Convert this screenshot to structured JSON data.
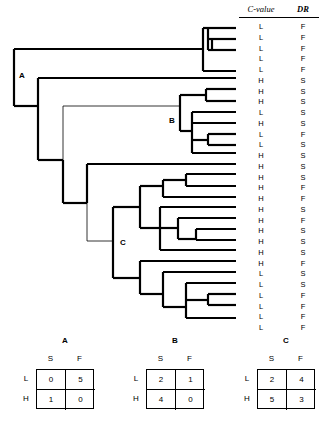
{
  "figure": {
    "type": "phylogenetic-tree-with-character-states"
  },
  "columns": {
    "cvalue_header": "C-value",
    "dr_header": "DR"
  },
  "clade_labels": {
    "a": "A",
    "b": "B",
    "c": "C"
  },
  "tips": [
    {
      "cvalue": "L",
      "dr": "F"
    },
    {
      "cvalue": "L",
      "dr": "F"
    },
    {
      "cvalue": "L",
      "dr": "F"
    },
    {
      "cvalue": "L",
      "dr": "F"
    },
    {
      "cvalue": "L",
      "dr": "F"
    },
    {
      "cvalue": "H",
      "dr": "S"
    },
    {
      "cvalue": "H",
      "dr": "S"
    },
    {
      "cvalue": "H",
      "dr": "S"
    },
    {
      "cvalue": "L",
      "dr": "S"
    },
    {
      "cvalue": "H",
      "dr": "S"
    },
    {
      "cvalue": "L",
      "dr": "F"
    },
    {
      "cvalue": "L",
      "dr": "S"
    },
    {
      "cvalue": "H",
      "dr": "S"
    },
    {
      "cvalue": "H",
      "dr": "S"
    },
    {
      "cvalue": "H",
      "dr": "S"
    },
    {
      "cvalue": "H",
      "dr": "F"
    },
    {
      "cvalue": "H",
      "dr": "F"
    },
    {
      "cvalue": "H",
      "dr": "S"
    },
    {
      "cvalue": "H",
      "dr": "F"
    },
    {
      "cvalue": "H",
      "dr": "S"
    },
    {
      "cvalue": "H",
      "dr": "S"
    },
    {
      "cvalue": "H",
      "dr": "S"
    },
    {
      "cvalue": "H",
      "dr": "F"
    },
    {
      "cvalue": "L",
      "dr": "S"
    },
    {
      "cvalue": "L",
      "dr": "S"
    },
    {
      "cvalue": "L",
      "dr": "F"
    },
    {
      "cvalue": "L",
      "dr": "F"
    },
    {
      "cvalue": "L",
      "dr": "F"
    },
    {
      "cvalue": "L",
      "dr": "F"
    }
  ],
  "tables": [
    {
      "id": "A",
      "title": "A",
      "col_headers": [
        "S",
        "F"
      ],
      "row_headers": [
        "L",
        "H"
      ],
      "values": [
        [
          0,
          5
        ],
        [
          1,
          0
        ]
      ]
    },
    {
      "id": "B",
      "title": "B",
      "col_headers": [
        "S",
        "F"
      ],
      "row_headers": [
        "L",
        "H"
      ],
      "values": [
        [
          2,
          1
        ],
        [
          4,
          0
        ]
      ]
    },
    {
      "id": "C",
      "title": "C",
      "col_headers": [
        "S",
        "F"
      ],
      "row_headers": [
        "L",
        "H"
      ],
      "values": [
        [
          2,
          4
        ],
        [
          5,
          3
        ]
      ]
    }
  ],
  "chart_data": {
    "type": "table",
    "title": "",
    "categories": [
      "C-value",
      "DR"
    ],
    "states": {
      "C-value": [
        "L",
        "H"
      ],
      "DR": [
        "S",
        "F"
      ]
    },
    "tip_count": 29,
    "contingency": {
      "A": {
        "L": {
          "S": 0,
          "F": 5
        },
        "H": {
          "S": 1,
          "F": 0
        }
      },
      "B": {
        "L": {
          "S": 2,
          "F": 1
        },
        "H": {
          "S": 4,
          "F": 0
        }
      },
      "C": {
        "L": {
          "S": 2,
          "F": 4
        },
        "H": {
          "S": 5,
          "F": 3
        }
      }
    }
  }
}
